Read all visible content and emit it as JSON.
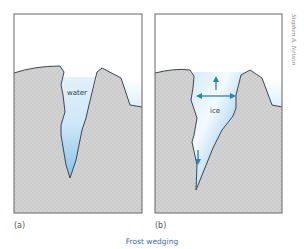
{
  "figure": {
    "caption": "Frost wedging",
    "credit": "Stephen A. Nelson",
    "colors": {
      "sky_top": "#ffffff",
      "water_blue": "#a9d3ee",
      "rock_fill": "#d2d2d2",
      "outline": "#3c4650",
      "crack_fill_light": "#e6f3fb",
      "crack_fill_deep": "#8cc6ee",
      "arrow": "#2a7fbf",
      "caption": "#3a6ea5"
    },
    "panels": [
      {
        "id": "a",
        "label": "(a)",
        "inner_label": "water"
      },
      {
        "id": "b",
        "label": "(b)",
        "inner_label": "ice",
        "arrows": [
          "up",
          "left",
          "right",
          "down"
        ]
      }
    ]
  }
}
